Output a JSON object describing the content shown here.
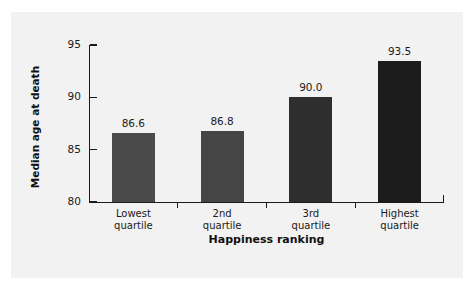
{
  "figure": {
    "background_color": "#ffffff",
    "panel_color": "#f2f2f2",
    "axis_color": "#1a1a1a"
  },
  "chart_data": {
    "type": "bar",
    "title": "",
    "subtitle": "",
    "xlabel": "Happiness ranking",
    "ylabel": "Median age at death",
    "categories": [
      "Lowest quartile",
      "2nd quartile",
      "3rd quartile",
      "Highest quartile"
    ],
    "category_lines": [
      [
        "Lowest",
        "quartile"
      ],
      [
        "2nd",
        "quartile"
      ],
      [
        "3rd",
        "quartile"
      ],
      [
        "Highest",
        "quartile"
      ]
    ],
    "values": [
      86.6,
      86.8,
      90.0,
      93.5
    ],
    "value_labels": [
      "86.6",
      "86.8",
      "90.0",
      "93.5"
    ],
    "bar_colors": [
      "#4a4a4a",
      "#454545",
      "#2e2e2e",
      "#1c1c1c"
    ],
    "ylim": [
      80,
      95
    ],
    "yticks": [
      80,
      85,
      90,
      95
    ],
    "ytick_labels": [
      "80",
      "85",
      "90",
      "95"
    ],
    "grid": false,
    "legend": false,
    "legend_position": "none"
  }
}
